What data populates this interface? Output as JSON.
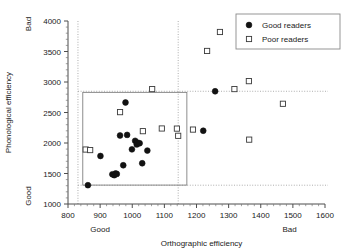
{
  "chart_data": {
    "type": "scatter",
    "title": "",
    "xlabel": "Orthographic efficiency",
    "ylabel": "Phonological efficiency",
    "xlim": [
      800,
      1600
    ],
    "ylim": [
      1000,
      4000
    ],
    "xticks": [
      800,
      900,
      1000,
      1100,
      1200,
      1300,
      1400,
      1500,
      1600
    ],
    "yticks": [
      1000,
      1500,
      2000,
      2500,
      3000,
      3500,
      4000
    ],
    "x_axis_low_label": "Good",
    "x_axis_high_label": "Bad",
    "y_axis_low_label": "Good",
    "y_axis_high_label": "Bad",
    "grid": false,
    "legend_position": "top-right",
    "series": [
      {
        "name": "Good readers",
        "marker": "filled-circle",
        "color": "#121212",
        "points": [
          [
            862,
            1308
          ],
          [
            901,
            1787
          ],
          [
            938,
            1487
          ],
          [
            944,
            1472
          ],
          [
            948,
            1500
          ],
          [
            952,
            1493
          ],
          [
            962,
            2123
          ],
          [
            972,
            1635
          ],
          [
            979,
            2664
          ],
          [
            984,
            2133
          ],
          [
            999,
            1896
          ],
          [
            1009,
            2036
          ],
          [
            1014,
            1976
          ],
          [
            1016,
            2007
          ],
          [
            1023,
            1996
          ],
          [
            1031,
            1668
          ],
          [
            1047,
            1876
          ],
          [
            1221,
            2201
          ],
          [
            1258,
            2848
          ]
        ]
      },
      {
        "name": "Poor readers",
        "marker": "open-square",
        "color": "#3a3a3a",
        "points": [
          [
            855,
            1893
          ],
          [
            869,
            1884
          ],
          [
            962,
            2506
          ],
          [
            1033,
            2194
          ],
          [
            1062,
            2884
          ],
          [
            1092,
            2238
          ],
          [
            1139,
            2236
          ],
          [
            1143,
            2118
          ],
          [
            1189,
            2220
          ],
          [
            1233,
            3509
          ],
          [
            1273,
            3820
          ],
          [
            1318,
            2884
          ],
          [
            1363,
            3014
          ],
          [
            1364,
            2055
          ],
          [
            1469,
            2643
          ]
        ]
      }
    ],
    "reference_box": {
      "x_min": 846,
      "x_max": 1170,
      "y_min": 1310,
      "y_max": 2830,
      "stroke": "#808080"
    },
    "reference_lines": [
      {
        "orientation": "vertical",
        "value": 831,
        "style": "dotted"
      },
      {
        "orientation": "vertical",
        "value": 1143,
        "style": "dotted"
      },
      {
        "orientation": "horizontal",
        "value": 2848,
        "style": "dotted"
      },
      {
        "orientation": "horizontal",
        "value": 1308,
        "style": "dotted"
      }
    ]
  },
  "legend": {
    "entries": [
      {
        "label": "Good readers",
        "marker": "filled-circle"
      },
      {
        "label": "Poor readers",
        "marker": "open-square"
      }
    ]
  },
  "axes": {
    "x_title": "Orthographic efficiency",
    "y_title": "Phonological efficiency",
    "x_tick_labels": [
      "800",
      "900",
      "1000",
      "1100",
      "1200",
      "1300",
      "1400",
      "1500",
      "1600"
    ],
    "y_tick_labels": [
      "1000",
      "1500",
      "2000",
      "2500",
      "3000",
      "3500",
      "4000"
    ],
    "x_low": "Good",
    "x_high": "Bad",
    "y_low": "Good",
    "y_high": "Bad"
  }
}
